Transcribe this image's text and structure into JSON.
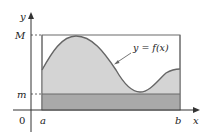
{
  "diagram": {
    "type": "area-under-curve-bounds",
    "labels": {
      "y_axis": "y",
      "x_axis": "x",
      "max": "M",
      "min": "m",
      "origin": "0",
      "a": "a",
      "b": "b",
      "curve": "y = f(x)"
    },
    "colors": {
      "curve_fill": "#d4d4d4",
      "min_band_fill": "#a9a9a9",
      "stroke": "#555555",
      "curve_stroke": "#666666",
      "axis": "#333333"
    }
  }
}
